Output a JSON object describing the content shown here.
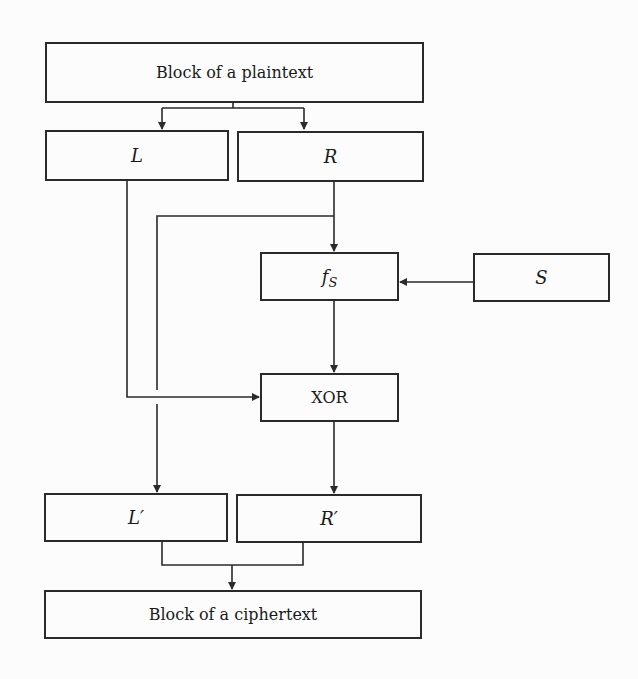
{
  "diagram": {
    "type": "Feistel round (block cipher) flow",
    "nodes": {
      "plaintext": {
        "label": "Block of a plaintext"
      },
      "left": {
        "label": "L"
      },
      "right": {
        "label": "R"
      },
      "round_function": {
        "label": "f",
        "subscript": "S"
      },
      "subkey": {
        "label": "S"
      },
      "xor": {
        "label": "XOR"
      },
      "left_out": {
        "label": "L′"
      },
      "right_out": {
        "label": "R′"
      },
      "ciphertext": {
        "label": "Block of a ciphertext"
      }
    },
    "edges": [
      {
        "from": "plaintext",
        "to": "left"
      },
      {
        "from": "plaintext",
        "to": "right"
      },
      {
        "from": "right",
        "to": "round_function"
      },
      {
        "from": "right",
        "to": "left_out"
      },
      {
        "from": "subkey",
        "to": "round_function"
      },
      {
        "from": "round_function",
        "to": "xor"
      },
      {
        "from": "left",
        "to": "xor"
      },
      {
        "from": "xor",
        "to": "right_out"
      },
      {
        "from": "left_out",
        "to": "ciphertext"
      },
      {
        "from": "right_out",
        "to": "ciphertext"
      }
    ],
    "colors": {
      "stroke": "#2a2a2a",
      "background": "#fcfcfc"
    }
  }
}
